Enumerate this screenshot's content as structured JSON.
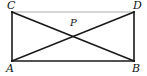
{
  "figure": {
    "kind": "geometry-diagram",
    "width": 147,
    "height": 76,
    "background_color": "#ffffff"
  },
  "style": {
    "dark_stroke_color": "#1a1a1a",
    "faint_stroke_color": "#c9c9c9",
    "dark_stroke_width": 1.6,
    "faint_stroke_width": 1.3,
    "label_color": "#111111"
  },
  "points": [
    {
      "id": "C",
      "label": "C",
      "x": 12,
      "y": 12,
      "label_x": 7,
      "label_y": 0,
      "type": "vertex"
    },
    {
      "id": "D",
      "label": "D",
      "x": 134,
      "y": 12,
      "label_x": 133,
      "label_y": 0,
      "type": "vertex"
    },
    {
      "id": "A",
      "label": "A",
      "x": 12,
      "y": 61,
      "label_x": 6,
      "label_y": 63,
      "type": "vertex"
    },
    {
      "id": "B",
      "label": "B",
      "x": 134,
      "y": 61,
      "label_x": 132,
      "label_y": 63,
      "type": "vertex"
    },
    {
      "id": "P",
      "label": "P",
      "x": 74,
      "y": 33,
      "label_x": 70,
      "label_y": 18,
      "type": "intersection"
    }
  ],
  "segments": [
    {
      "id": "CA",
      "from": "C",
      "to": "A",
      "shade": "dark",
      "name": "left-side-CA"
    },
    {
      "id": "DB",
      "from": "D",
      "to": "B",
      "shade": "dark",
      "name": "right-side-DB"
    },
    {
      "id": "AB",
      "from": "A",
      "to": "B",
      "shade": "dark",
      "name": "bottom-side-AB"
    },
    {
      "id": "CD",
      "from": "C",
      "to": "D",
      "shade": "faint",
      "name": "top-side-CD"
    },
    {
      "id": "CB",
      "from": "C",
      "to": "B",
      "shade": "dark",
      "name": "diagonal-CB"
    },
    {
      "id": "AD",
      "from": "A",
      "to": "D",
      "shade": "dark",
      "name": "diagonal-AD"
    }
  ]
}
